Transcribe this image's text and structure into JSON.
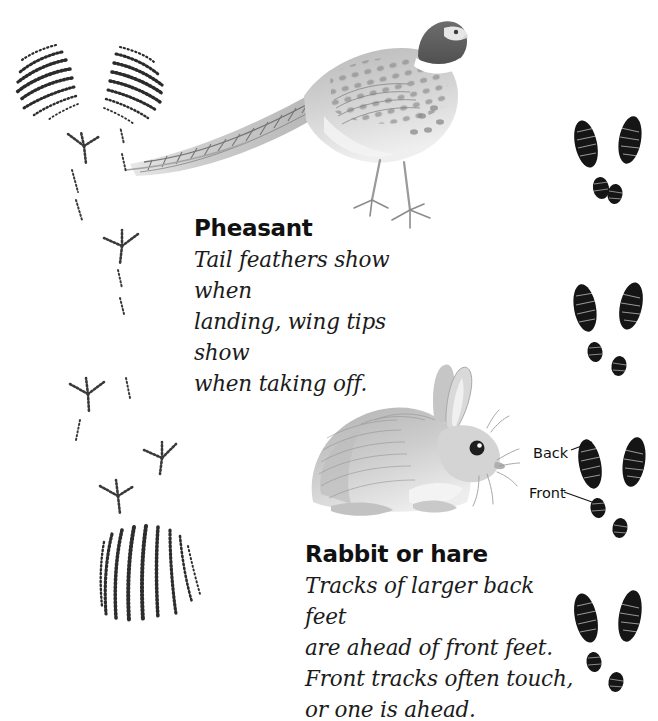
{
  "page": {
    "background": "#ffffff",
    "width": 658,
    "height": 711,
    "ink_color": "#1a1a1a"
  },
  "entries": [
    {
      "id": "pheasant",
      "heading": "Pheasant",
      "body": "Tail feathers show when\nlanding, wing tips show\nwhen taking off.",
      "illustration": "pheasant-illustration"
    },
    {
      "id": "rabbit",
      "heading": "Rabbit or hare",
      "body": "Tracks of larger back feet\nare ahead of front feet.\nFront tracks often touch,\nor one is ahead.",
      "illustration": "rabbit-illustration"
    }
  ],
  "callouts": [
    {
      "id": "back",
      "label": "Back"
    },
    {
      "id": "front",
      "label": "Front"
    }
  ],
  "track_plates": [
    {
      "id": "pheasant-wingtips",
      "name": "wing-tip-impressions",
      "description": "Paired fan-shaped wing tip marks made of curved hatch strokes"
    },
    {
      "id": "pheasant-footprints",
      "name": "bird-footprints",
      "description": "Three-toed tracks with small rear toe, sketched in thin strokes"
    },
    {
      "id": "pheasant-tailmark",
      "name": "tail-feather-drag",
      "description": "Vertical fanned hatch lines left by dragging tail feathers"
    },
    {
      "id": "rabbit-tracks-1",
      "name": "rabbit-track-set",
      "description": "Two long back prints above two touching front prints"
    },
    {
      "id": "rabbit-tracks-2",
      "name": "rabbit-track-set",
      "description": "Two long back prints above two separated front prints"
    },
    {
      "id": "rabbit-tracks-3",
      "name": "rabbit-track-set",
      "description": "Labelled set showing back prints and front prints"
    },
    {
      "id": "rabbit-tracks-4",
      "name": "rabbit-track-set",
      "description": "Two long back prints above two offset front prints"
    }
  ]
}
